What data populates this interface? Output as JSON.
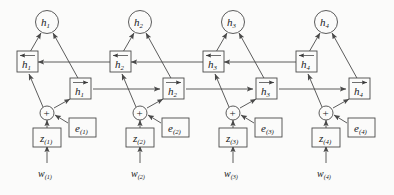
{
  "figure": {
    "type": "neural-network-diagram",
    "colors": {
      "stroke": "#4a4a4a",
      "text": "#1a1a1a",
      "background": "#fbfbfa"
    },
    "timesteps": [
      {
        "index": 1,
        "output_node": {
          "base": "h",
          "sub": "1"
        },
        "backward_state": {
          "base": "h",
          "sub": "1"
        },
        "forward_state": {
          "base": "h",
          "sub": "1"
        },
        "sum_node": "+",
        "embedding": {
          "base": "e",
          "sub": "(1)"
        },
        "latent": {
          "base": "z",
          "sub": "(1)"
        },
        "input": {
          "base": "w",
          "sub": "(1)"
        }
      },
      {
        "index": 2,
        "output_node": {
          "base": "h",
          "sub": "2"
        },
        "backward_state": {
          "base": "h",
          "sub": "2"
        },
        "forward_state": {
          "base": "h",
          "sub": "2"
        },
        "sum_node": "+",
        "embedding": {
          "base": "e",
          "sub": "(2)"
        },
        "latent": {
          "base": "z",
          "sub": "(2)"
        },
        "input": {
          "base": "w",
          "sub": "(2)"
        }
      },
      {
        "index": 3,
        "output_node": {
          "base": "h",
          "sub": "3"
        },
        "backward_state": {
          "base": "h",
          "sub": "3"
        },
        "forward_state": {
          "base": "h",
          "sub": "3"
        },
        "sum_node": "+",
        "embedding": {
          "base": "e",
          "sub": "(3)"
        },
        "latent": {
          "base": "z",
          "sub": "(3)"
        },
        "input": {
          "base": "w",
          "sub": "(3)"
        }
      },
      {
        "index": 4,
        "output_node": {
          "base": "h",
          "sub": "4"
        },
        "backward_state": {
          "base": "h",
          "sub": "4"
        },
        "forward_state": {
          "base": "h",
          "sub": "4"
        },
        "sum_node": "+",
        "embedding": {
          "base": "e",
          "sub": "(4)"
        },
        "latent": {
          "base": "z",
          "sub": "(4)"
        },
        "input": {
          "base": "w",
          "sub": "(4)"
        }
      }
    ]
  }
}
